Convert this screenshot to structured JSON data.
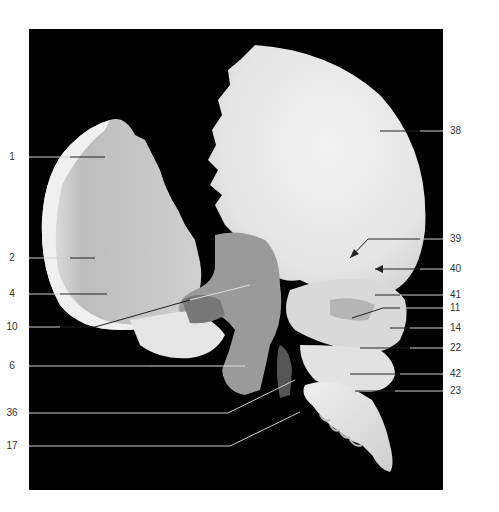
{
  "figure": {
    "background": "#000000",
    "label_color": "#333333",
    "labels_left": [
      {
        "text": "1",
        "y": 157
      },
      {
        "text": "2",
        "y": 258
      },
      {
        "text": "4",
        "y": 294
      },
      {
        "text": "10",
        "y": 327
      },
      {
        "text": "6",
        "y": 366
      },
      {
        "text": "36",
        "y": 413
      },
      {
        "text": "17",
        "y": 446
      }
    ],
    "labels_right": [
      {
        "text": "38",
        "y": 131
      },
      {
        "text": "39",
        "y": 239
      },
      {
        "text": "40",
        "y": 269
      },
      {
        "text": "41",
        "y": 295
      },
      {
        "text": "11",
        "y": 308
      },
      {
        "text": "14",
        "y": 328
      },
      {
        "text": "22",
        "y": 348
      },
      {
        "text": "42",
        "y": 374
      },
      {
        "text": "23",
        "y": 391
      }
    ]
  }
}
